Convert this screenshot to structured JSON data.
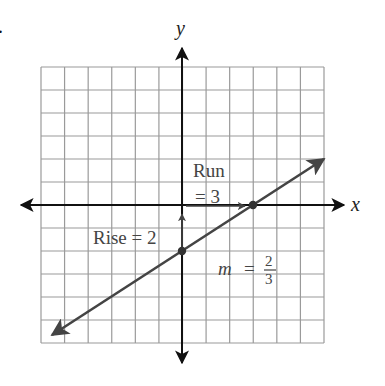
{
  "figure": {
    "stray_mark": ".",
    "axes": {
      "x_label": "x",
      "y_label": "y",
      "x_range": [
        -6,
        6
      ],
      "y_range": [
        -6,
        6
      ],
      "grid_step": 1
    },
    "line": {
      "slope_num": "2",
      "slope_den": "3",
      "y_intercept": -2,
      "x_intercept": 3,
      "from": [
        -6,
        -6
      ],
      "to": [
        6,
        2
      ]
    },
    "points": [
      {
        "x": 0,
        "y": -2
      },
      {
        "x": 3,
        "y": 0
      }
    ],
    "annotations": {
      "run_line1": "Run",
      "run_line2": "= 3",
      "rise": "Rise = 2",
      "slope_m": "m",
      "slope_eq": "=",
      "slope_num": "2",
      "slope_den": "3"
    },
    "colors": {
      "grid": "#9a9a9a",
      "axes": "#111111",
      "line": "#444444",
      "text": "#444444"
    }
  },
  "chart_data": {
    "type": "line",
    "title": "",
    "xlabel": "x",
    "ylabel": "y",
    "xlim": [
      -6,
      6
    ],
    "ylim": [
      -6,
      6
    ],
    "grid": true,
    "series": [
      {
        "name": "y = (2/3)x - 2",
        "x": [
          -6,
          0,
          3,
          6
        ],
        "y": [
          -6,
          -2,
          0,
          2
        ]
      }
    ],
    "annotations": [
      "Run = 3",
      "Rise = 2",
      "m = 2/3"
    ]
  }
}
